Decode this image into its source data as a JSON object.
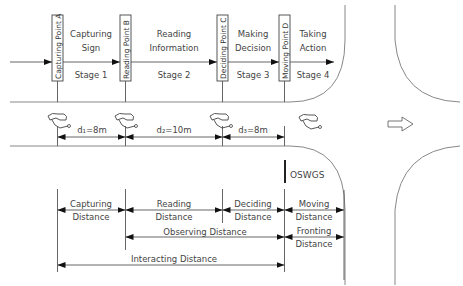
{
  "top": {
    "points": [
      {
        "id": "A",
        "label": "Capturing Point A"
      },
      {
        "id": "B",
        "label": "Reading Point B"
      },
      {
        "id": "C",
        "label": "Deciding Point C"
      },
      {
        "id": "D",
        "label": "Moving Point D"
      }
    ],
    "stages": [
      {
        "line1": "Capturing",
        "line2": "Sign",
        "stage": "Stage 1"
      },
      {
        "line1": "Reading",
        "line2": "Information",
        "stage": "Stage 2"
      },
      {
        "line1": "Making",
        "line2": "Decision",
        "stage": "Stage 3"
      },
      {
        "line1": "Taking",
        "line2": "Action",
        "stage": "Stage 4"
      }
    ]
  },
  "road": {
    "gaps": [
      {
        "label": "d₁=8m"
      },
      {
        "label": "d₂=10m"
      },
      {
        "label": "d₃=8m"
      }
    ],
    "sign_label": "OSWGS",
    "direction_icon": "right-arrow-outline"
  },
  "distances": {
    "capturing": [
      "Capturing",
      "Distance"
    ],
    "reading": [
      "Reading",
      "Distance"
    ],
    "deciding": [
      "Deciding",
      "Distance"
    ],
    "moving": [
      "Moving",
      "Distance"
    ],
    "observing": "Observing Distance",
    "fronting": [
      "Fronting",
      "Distance"
    ],
    "interacting": "Interacting Distance"
  }
}
